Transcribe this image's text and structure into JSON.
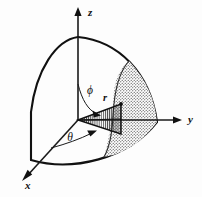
{
  "figure": {
    "name": "spherical-coordinates-octant-diagram",
    "background_color": "#fdfdfd",
    "ink_color": "#111111",
    "axes": [
      {
        "id": "z",
        "label": "z",
        "direction": "up",
        "label_x": 88,
        "label_y": 16
      },
      {
        "id": "y",
        "label": "y",
        "direction": "right",
        "label_x": 188,
        "label_y": 123
      },
      {
        "id": "x",
        "label": "x",
        "direction": "down-left",
        "label_x": 25,
        "label_y": 189
      }
    ],
    "angles": [
      {
        "id": "phi",
        "label": "ϕ",
        "from_axis": "z",
        "label_x": 90,
        "label_y": 94
      },
      {
        "id": "theta",
        "label": "θ",
        "from_axis": "x",
        "label_x": 70,
        "label_y": 141
      }
    ],
    "radius": {
      "id": "r",
      "label": "r",
      "label_x": 105,
      "label_y": 101
    },
    "regions": [
      {
        "id": "solid-angle-wedge",
        "fill": "vertical-hatching"
      },
      {
        "id": "spherical-lune-patch",
        "fill": "stipple-dots"
      },
      {
        "id": "sphere-octant",
        "fill": "none"
      }
    ]
  }
}
